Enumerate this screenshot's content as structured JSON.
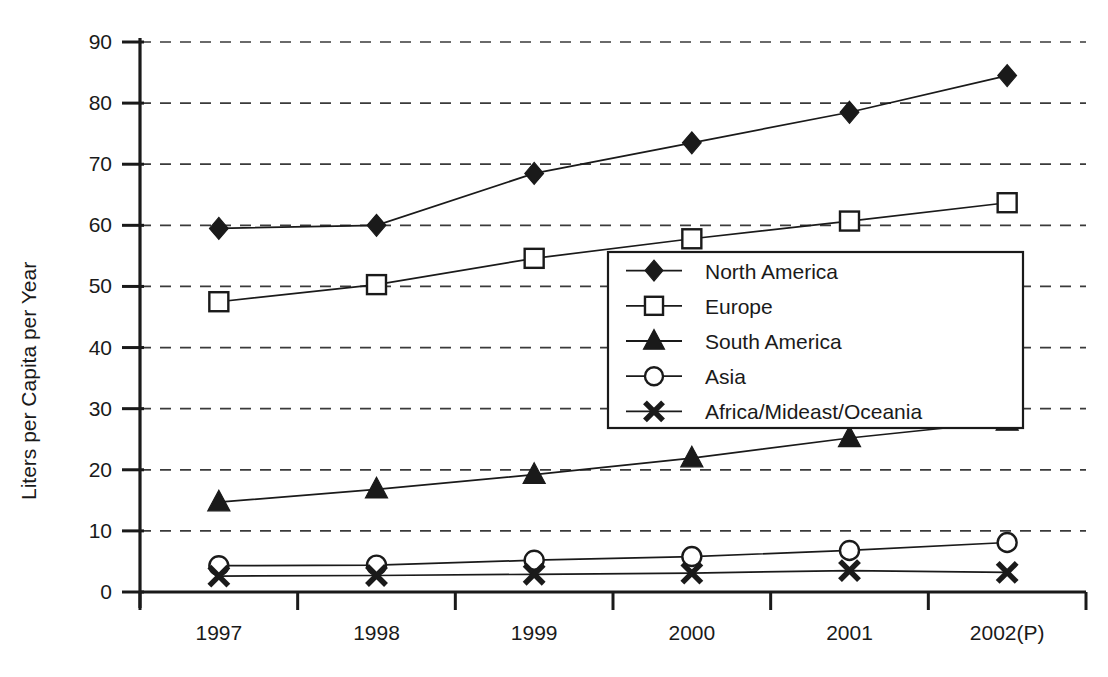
{
  "chart_data": {
    "type": "line",
    "title": "",
    "subtitle": "",
    "xlabel": "",
    "ylabel": "Liters per Capita per Year",
    "categories": [
      "1997",
      "1998",
      "1999",
      "2000",
      "2001",
      "2002(P)"
    ],
    "ylim": [
      0,
      90
    ],
    "yticks": [
      0,
      10,
      20,
      30,
      40,
      50,
      60,
      70,
      80,
      90
    ],
    "ytick_labels": [
      "0",
      "10",
      "20",
      "30",
      "40",
      "50",
      "60",
      "70",
      "80",
      "90"
    ],
    "grid": "horizontal-dashed",
    "legend_position": "center-right-inside",
    "series": [
      {
        "name": "North America",
        "marker": "filled-diamond",
        "color": "#1a1a1a",
        "values": [
          59.5,
          60.0,
          68.5,
          73.5,
          78.5,
          84.5
        ]
      },
      {
        "name": "Europe",
        "marker": "open-square",
        "color": "#1a1a1a",
        "values": [
          47.5,
          50.3,
          54.6,
          57.8,
          60.7,
          63.7
        ]
      },
      {
        "name": "South America",
        "marker": "filled-triangle",
        "color": "#1a1a1a",
        "values": [
          14.7,
          16.8,
          19.2,
          21.9,
          25.2,
          27.9
        ]
      },
      {
        "name": "Asia",
        "marker": "open-circle",
        "color": "#1a1a1a",
        "values": [
          4.3,
          4.4,
          5.2,
          5.8,
          6.8,
          8.1
        ]
      },
      {
        "name": "Africa/Mideast/Oceania",
        "marker": "bold-cross",
        "color": "#1a1a1a",
        "values": [
          2.6,
          2.7,
          2.9,
          3.1,
          3.5,
          3.2
        ]
      }
    ]
  },
  "legend": {
    "entries": [
      {
        "label": "North America",
        "marker": "filled-diamond"
      },
      {
        "label": "Europe",
        "marker": "open-square"
      },
      {
        "label": "South America",
        "marker": "filled-triangle"
      },
      {
        "label": "Asia",
        "marker": "open-circle"
      },
      {
        "label": "Africa/Mideast/Oceania",
        "marker": "bold-cross"
      }
    ]
  },
  "colors": {
    "ink": "#1a1a1a",
    "grid": "#3a3a3a",
    "background": "#ffffff"
  }
}
